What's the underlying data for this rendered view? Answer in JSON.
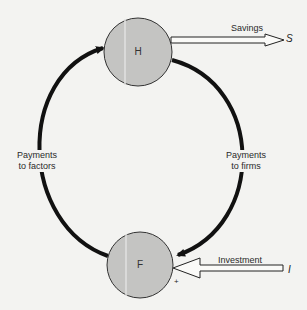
{
  "diagram": {
    "type": "circular-flow",
    "nodes": {
      "households": {
        "label": "H"
      },
      "firms": {
        "label": "F"
      }
    },
    "flows": {
      "left": {
        "label_line1": "Payments",
        "label_line2": "to factors"
      },
      "right": {
        "label_line1": "Payments",
        "label_line2": "to firms"
      },
      "leak": {
        "label": "Savings",
        "symbol": "S"
      },
      "injection": {
        "label": "Investment",
        "symbol": "I",
        "sign": "+"
      }
    },
    "colors": {
      "node_fill": "#c4c4c2",
      "loop_stroke": "#111111",
      "background": "#f3f3f1"
    }
  }
}
